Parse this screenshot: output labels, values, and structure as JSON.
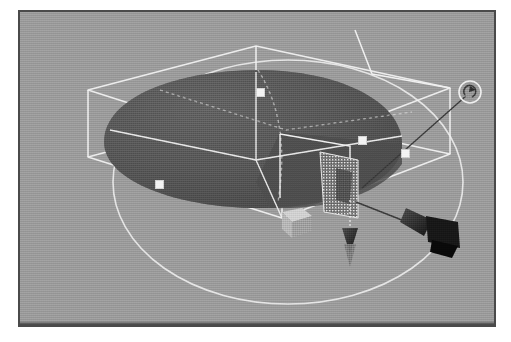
{
  "app": {
    "window_title": "3D Viewport",
    "view_label": "Perspective"
  },
  "viewport": {
    "background_color": "#989898",
    "frame_color": "#4a4a4a",
    "wireframe_color": "#f0f0f0",
    "object_fill_color": "#555555",
    "object_shadow_color": "#3f3f3f",
    "handle_fill_color": "#f2f2f2",
    "gizmo_dark_color": "#222222",
    "gizmo_light_color": "#b8b8b8"
  },
  "scene": {
    "object_name": "ellipsoid-dome-mesh",
    "selection_state": "selected",
    "bounding_box_name": "selection-bounding-box",
    "rotation_ring_name": "rotation-ring",
    "hatch_region_name": "hatched-face-region"
  },
  "gizmo": {
    "rotate_handle_label": "rotate",
    "rotate_handle_glyph": "↻",
    "translate_y_handle_label": "translate-y",
    "translate_axis_handle_label": "translate-axis",
    "scale_cube_handle_label": "scale-cube"
  },
  "handles": {
    "items": [
      {
        "name": "bbox-handle-top",
        "x": 258,
        "y": 90
      },
      {
        "name": "bbox-handle-right-upper",
        "x": 360,
        "y": 138
      },
      {
        "name": "bbox-handle-right-lower",
        "x": 403,
        "y": 151
      },
      {
        "name": "bbox-handle-left",
        "x": 157,
        "y": 182
      }
    ]
  }
}
